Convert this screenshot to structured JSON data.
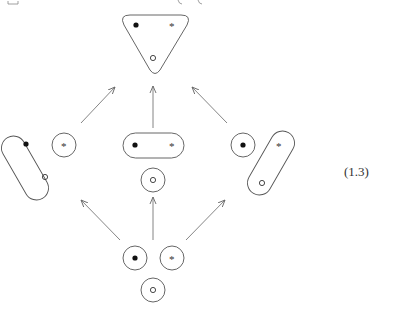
{
  "equation_label": "(1.3)",
  "legend_symbols": {
    "filled_dot": "●",
    "star": "*",
    "open_circle": "○"
  },
  "nodes": [
    {
      "id": "top",
      "description": "single block containing all three elements (filled dot, star, open circle)",
      "shape": "rounded triangle"
    },
    {
      "id": "left",
      "description": "block {filled dot, open circle} and singleton {star}"
    },
    {
      "id": "center",
      "description": "block {filled dot, star} and singleton {open circle}"
    },
    {
      "id": "right",
      "description": "singleton {filled dot} and block {star, open circle}"
    },
    {
      "id": "bottom",
      "description": "three singletons {filled dot}, {star}, {open circle}"
    }
  ],
  "edges": [
    {
      "from": "left",
      "to": "top"
    },
    {
      "from": "center",
      "to": "top"
    },
    {
      "from": "right",
      "to": "top"
    },
    {
      "from": "bottom",
      "to": "left"
    },
    {
      "from": "bottom",
      "to": "center"
    },
    {
      "from": "bottom",
      "to": "right"
    }
  ],
  "colors": {
    "stroke": "#555555",
    "dot": "#111111",
    "background": "#ffffff"
  }
}
